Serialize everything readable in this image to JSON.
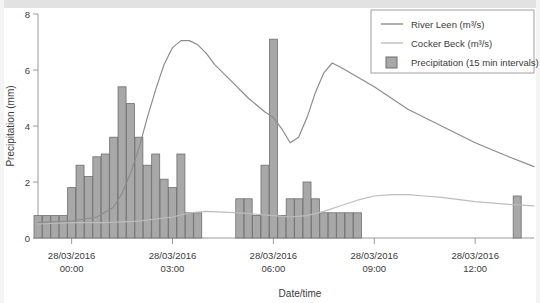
{
  "chart_data": {
    "type": "bar",
    "title": "",
    "subtitle": "",
    "xlabel": "Date/time",
    "ylabel": "Precipitation (mm)",
    "ylim": [
      0,
      8
    ],
    "yticks": [
      0,
      2,
      4,
      6,
      8
    ],
    "ytick_labels": [
      "0",
      "2",
      "4",
      "6",
      "8"
    ],
    "xlim": [
      "28/03/2016 23:00",
      "28/03/2016 13:45"
    ],
    "xticks": [
      "28/03/2016 00:00",
      "28/03/2016 03:00",
      "28/03/2016 06:00",
      "28/03/2016 09:00",
      "28/03/2016 12:00"
    ],
    "xtick_labels": [
      {
        "line1": "28/03/2016",
        "line2": "00:00"
      },
      {
        "line1": "28/03/2016",
        "line2": "03:00"
      },
      {
        "line1": "28/03/2016",
        "line2": "06:00"
      },
      {
        "line1": "28/03/2016",
        "line2": "09:00"
      },
      {
        "line1": "28/03/2016",
        "line2": "12:00"
      }
    ],
    "grid": false,
    "legend_position": "top-right",
    "legend": [
      {
        "label": "River Leen (m³/s)",
        "type": "line",
        "color": "#8c8c8c"
      },
      {
        "label": "Cocker Beck (m³/s)",
        "type": "line",
        "color": "#bdbdbd"
      },
      {
        "label": "Precipitation (15 min intervals)",
        "type": "bar",
        "color": "#a8a8a8"
      }
    ],
    "series": [
      {
        "name": "Precipitation (15 min intervals)",
        "type": "bar",
        "unit": "mm",
        "interval_min": 15,
        "color": "#a8a8a8",
        "edge_color": "#6e6e6e",
        "x": [
          "23:00",
          "23:15",
          "23:30",
          "23:45",
          "00:00",
          "00:15",
          "00:30",
          "00:45",
          "01:00",
          "01:15",
          "01:30",
          "01:45",
          "02:00",
          "02:15",
          "02:30",
          "02:45",
          "03:00",
          "03:15",
          "03:30",
          "03:45",
          "05:00",
          "05:15",
          "05:30",
          "05:45",
          "06:00",
          "06:15",
          "06:30",
          "06:45",
          "07:00",
          "07:15",
          "07:30",
          "07:45",
          "08:00",
          "08:15",
          "08:30",
          "13:15"
        ],
        "values": [
          0.8,
          0.8,
          0.8,
          0.8,
          1.8,
          2.6,
          2.2,
          2.9,
          3.0,
          3.6,
          5.4,
          4.8,
          3.6,
          2.6,
          3.0,
          2.1,
          1.8,
          3.0,
          0.9,
          0.9,
          1.4,
          1.4,
          0.8,
          2.6,
          7.1,
          0.8,
          1.4,
          1.4,
          2.0,
          1.4,
          0.9,
          0.9,
          0.9,
          0.9,
          0.9,
          1.5
        ]
      },
      {
        "name": "River Leen (m³/s)",
        "type": "line",
        "unit": "m³/s",
        "color": "#8c8c8c",
        "x": [
          "23:00",
          "00:00",
          "00:45",
          "01:15",
          "01:30",
          "01:45",
          "02:00",
          "02:15",
          "02:30",
          "02:45",
          "03:00",
          "03:15",
          "03:30",
          "03:45",
          "04:00",
          "04:15",
          "04:45",
          "05:15",
          "05:45",
          "06:00",
          "06:15",
          "06:30",
          "06:45",
          "07:00",
          "07:15",
          "07:30",
          "07:45",
          "08:00",
          "08:30",
          "09:00",
          "09:30",
          "10:00",
          "11:00",
          "12:00",
          "13:00",
          "13:45"
        ],
        "values": [
          0.55,
          0.6,
          0.75,
          1.1,
          1.6,
          2.3,
          3.2,
          4.3,
          5.3,
          6.2,
          6.8,
          7.05,
          7.05,
          6.9,
          6.6,
          6.2,
          5.6,
          5.0,
          4.5,
          4.3,
          3.9,
          3.4,
          3.6,
          4.3,
          5.2,
          5.9,
          6.25,
          6.1,
          5.75,
          5.4,
          5.0,
          4.6,
          4.0,
          3.4,
          2.9,
          2.55
        ]
      },
      {
        "name": "Cocker Beck (m³/s)",
        "type": "line",
        "unit": "m³/s",
        "color": "#bdbdbd",
        "x": [
          "23:00",
          "00:00",
          "01:00",
          "02:00",
          "03:00",
          "03:30",
          "04:00",
          "05:00",
          "06:00",
          "06:30",
          "07:00",
          "07:30",
          "08:00",
          "08:30",
          "09:00",
          "09:30",
          "10:00",
          "10:30",
          "11:00",
          "12:00",
          "13:00",
          "13:45"
        ],
        "values": [
          0.5,
          0.55,
          0.55,
          0.6,
          0.75,
          0.9,
          0.95,
          0.9,
          0.8,
          0.75,
          0.8,
          0.95,
          1.15,
          1.35,
          1.5,
          1.55,
          1.55,
          1.5,
          1.45,
          1.3,
          1.2,
          1.15
        ]
      }
    ]
  },
  "axes": {
    "y_title": "Precipitation (mm)",
    "x_title": "Date/time"
  }
}
